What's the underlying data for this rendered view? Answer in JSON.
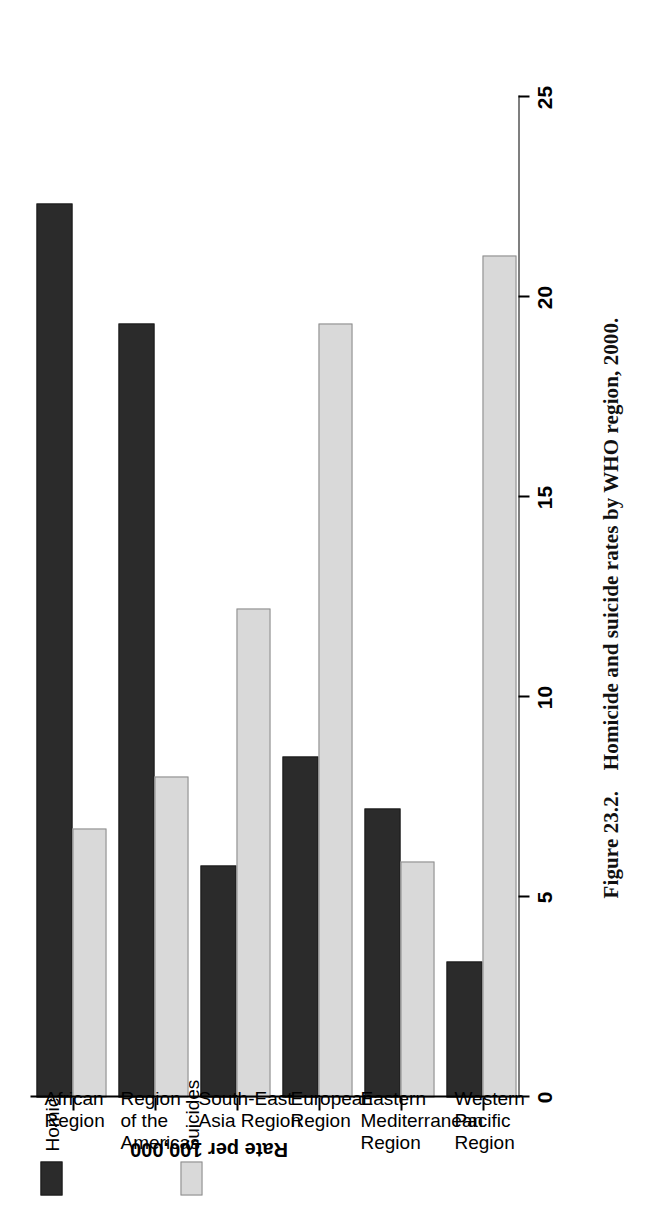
{
  "figure": {
    "number": "Figure 23.2.",
    "caption": "Homicide and suicide rates by WHO region, 2000.",
    "orientation": "rotated-90-ccw"
  },
  "legend": {
    "position": "top-left",
    "entries": [
      {
        "label": "Homicides",
        "swatch": "dark-gray",
        "color": "#2b2b2b"
      },
      {
        "label": "Suicides",
        "swatch": "light-gray",
        "color": "#d9d9d9"
      }
    ]
  },
  "axes": {
    "value_axis_label": "Rate per 100,000",
    "value_ticks": [
      "0",
      "5",
      "10",
      "15",
      "20",
      "25"
    ],
    "value_min": 0,
    "value_max": 25
  },
  "chart_data": {
    "type": "bar",
    "title": "Homicide and suicide rates by WHO region, 2000.",
    "xlabel": "",
    "ylabel": "Rate per 100,000",
    "ylim": [
      0,
      25
    ],
    "grid": false,
    "legend_position": "top-left",
    "orientation": "vertical-grouped",
    "categories": [
      "African Region",
      "Region of the Americas",
      "South-East Asia Region",
      "European Region",
      "Eastern Mediterranean Region",
      "Western Pacific Region"
    ],
    "category_label_lines": [
      [
        "African",
        "Region"
      ],
      [
        "Region",
        "of the",
        "Americas"
      ],
      [
        "South-East",
        "Asia Region"
      ],
      [
        "European",
        "Region"
      ],
      [
        "Eastern",
        "Mediterranean",
        "Region"
      ],
      [
        "Western",
        "Pacific",
        "Region"
      ]
    ],
    "series": [
      {
        "name": "Homicides",
        "color": "#2b2b2b",
        "values": [
          22.3,
          19.3,
          5.8,
          8.5,
          7.2,
          3.4
        ]
      },
      {
        "name": "Suicides",
        "color": "#d9d9d9",
        "values": [
          6.7,
          8.0,
          12.2,
          19.3,
          5.9,
          21.0
        ]
      }
    ]
  }
}
